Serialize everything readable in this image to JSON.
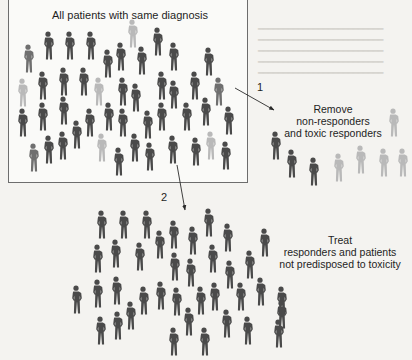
{
  "figure": {
    "box_title": "All patients with same diagnosis",
    "step1": {
      "number": "1",
      "lines": [
        "Remove",
        "non-responders",
        "and toxic responders"
      ]
    },
    "step2": {
      "number": "2",
      "lines": [
        "Treat",
        "responders and patients",
        "not predisposed to toxicity"
      ]
    }
  },
  "colors": {
    "responder": "#4a4a4a",
    "non_responder": "#b9b9b9",
    "mid": "#6f6f6f",
    "box_border": "#6d6d6d",
    "arrow": "#2a2a2a"
  },
  "figures": {
    "all_patients": [
      {
        "x": 48,
        "y": 31,
        "t": "d"
      },
      {
        "x": 69,
        "y": 31,
        "t": "d"
      },
      {
        "x": 90,
        "y": 31,
        "t": "d"
      },
      {
        "x": 132,
        "y": 19,
        "t": "l"
      },
      {
        "x": 157,
        "y": 27,
        "t": "d"
      },
      {
        "x": 28,
        "y": 44,
        "t": "m"
      },
      {
        "x": 107,
        "y": 49,
        "t": "d"
      },
      {
        "x": 120,
        "y": 42,
        "t": "d"
      },
      {
        "x": 141,
        "y": 46,
        "t": "d"
      },
      {
        "x": 173,
        "y": 42,
        "t": "d"
      },
      {
        "x": 208,
        "y": 47,
        "t": "d"
      },
      {
        "x": 22,
        "y": 78,
        "t": "l"
      },
      {
        "x": 42,
        "y": 71,
        "t": "d"
      },
      {
        "x": 63,
        "y": 67,
        "t": "d"
      },
      {
        "x": 83,
        "y": 67,
        "t": "d"
      },
      {
        "x": 98,
        "y": 77,
        "t": "l"
      },
      {
        "x": 122,
        "y": 77,
        "t": "d"
      },
      {
        "x": 135,
        "y": 83,
        "t": "d"
      },
      {
        "x": 161,
        "y": 71,
        "t": "d"
      },
      {
        "x": 173,
        "y": 80,
        "t": "d"
      },
      {
        "x": 194,
        "y": 71,
        "t": "d"
      },
      {
        "x": 218,
        "y": 77,
        "t": "m"
      },
      {
        "x": 22,
        "y": 108,
        "t": "d"
      },
      {
        "x": 42,
        "y": 102,
        "t": "d"
      },
      {
        "x": 63,
        "y": 96,
        "t": "d"
      },
      {
        "x": 89,
        "y": 108,
        "t": "d"
      },
      {
        "x": 108,
        "y": 102,
        "t": "d"
      },
      {
        "x": 122,
        "y": 108,
        "t": "d"
      },
      {
        "x": 147,
        "y": 110,
        "t": "d"
      },
      {
        "x": 161,
        "y": 102,
        "t": "d"
      },
      {
        "x": 186,
        "y": 102,
        "t": "d"
      },
      {
        "x": 205,
        "y": 97,
        "t": "d"
      },
      {
        "x": 228,
        "y": 106,
        "t": "d"
      },
      {
        "x": 76,
        "y": 120,
        "t": "d"
      },
      {
        "x": 33,
        "y": 143,
        "t": "m"
      },
      {
        "x": 48,
        "y": 135,
        "t": "d"
      },
      {
        "x": 62,
        "y": 131,
        "t": "d"
      },
      {
        "x": 101,
        "y": 133,
        "t": "l"
      },
      {
        "x": 118,
        "y": 147,
        "t": "d"
      },
      {
        "x": 134,
        "y": 133,
        "t": "d"
      },
      {
        "x": 149,
        "y": 142,
        "t": "d"
      },
      {
        "x": 172,
        "y": 135,
        "t": "d"
      },
      {
        "x": 195,
        "y": 137,
        "t": "d"
      },
      {
        "x": 210,
        "y": 131,
        "t": "l"
      },
      {
        "x": 225,
        "y": 141,
        "t": "d"
      }
    ],
    "removed": [
      {
        "x": 393,
        "y": 108,
        "t": "l"
      },
      {
        "x": 275,
        "y": 131,
        "t": "d"
      },
      {
        "x": 291,
        "y": 149,
        "t": "d"
      },
      {
        "x": 313,
        "y": 157,
        "t": "d"
      },
      {
        "x": 338,
        "y": 153,
        "t": "l"
      },
      {
        "x": 360,
        "y": 145,
        "t": "l"
      },
      {
        "x": 383,
        "y": 148,
        "t": "l"
      },
      {
        "x": 402,
        "y": 148,
        "t": "l"
      }
    ],
    "treated": [
      {
        "x": 101,
        "y": 210,
        "t": "d"
      },
      {
        "x": 123,
        "y": 210,
        "t": "d"
      },
      {
        "x": 146,
        "y": 210,
        "t": "d"
      },
      {
        "x": 208,
        "y": 208,
        "t": "d"
      },
      {
        "x": 173,
        "y": 220,
        "t": "d"
      },
      {
        "x": 192,
        "y": 226,
        "t": "d"
      },
      {
        "x": 159,
        "y": 230,
        "t": "d"
      },
      {
        "x": 227,
        "y": 223,
        "t": "d"
      },
      {
        "x": 264,
        "y": 228,
        "t": "d"
      },
      {
        "x": 97,
        "y": 244,
        "t": "d"
      },
      {
        "x": 115,
        "y": 239,
        "t": "d"
      },
      {
        "x": 139,
        "y": 242,
        "t": "d"
      },
      {
        "x": 174,
        "y": 252,
        "t": "d"
      },
      {
        "x": 190,
        "y": 258,
        "t": "d"
      },
      {
        "x": 212,
        "y": 244,
        "t": "d"
      },
      {
        "x": 229,
        "y": 260,
        "t": "d"
      },
      {
        "x": 249,
        "y": 250,
        "t": "d"
      },
      {
        "x": 76,
        "y": 285,
        "t": "d"
      },
      {
        "x": 97,
        "y": 279,
        "t": "d"
      },
      {
        "x": 116,
        "y": 276,
        "t": "d"
      },
      {
        "x": 143,
        "y": 286,
        "t": "d"
      },
      {
        "x": 160,
        "y": 281,
        "t": "d"
      },
      {
        "x": 176,
        "y": 287,
        "t": "d"
      },
      {
        "x": 200,
        "y": 286,
        "t": "d"
      },
      {
        "x": 214,
        "y": 282,
        "t": "d"
      },
      {
        "x": 240,
        "y": 282,
        "t": "d"
      },
      {
        "x": 260,
        "y": 277,
        "t": "d"
      },
      {
        "x": 281,
        "y": 286,
        "t": "d"
      },
      {
        "x": 100,
        "y": 316,
        "t": "d"
      },
      {
        "x": 117,
        "y": 311,
        "t": "d"
      },
      {
        "x": 130,
        "y": 301,
        "t": "d"
      },
      {
        "x": 188,
        "y": 307,
        "t": "d"
      },
      {
        "x": 226,
        "y": 309,
        "t": "d"
      },
      {
        "x": 247,
        "y": 316,
        "t": "d"
      },
      {
        "x": 278,
        "y": 319,
        "t": "d"
      },
      {
        "x": 173,
        "y": 327,
        "t": "d"
      },
      {
        "x": 204,
        "y": 327,
        "t": "d"
      },
      {
        "x": 281,
        "y": 300,
        "t": "d"
      }
    ]
  }
}
